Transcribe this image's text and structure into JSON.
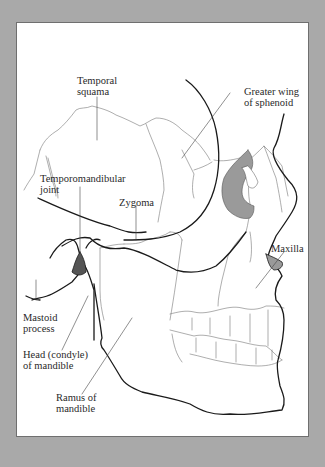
{
  "figure": {
    "background_color": "#a9a9a9",
    "frame_color": "#ffffff",
    "shade_dark": "#555555",
    "shade_mid": "#9a9a9a",
    "labels": {
      "temporal_squama": "Temporal\nsquama",
      "greater_wing": "Greater wing\nof sphenoid",
      "tmj": "Temporomandibular\njoint",
      "zygoma": "Zygoma",
      "maxilla": "Maxilla",
      "mastoid": "Mastoid\nprocess",
      "head_condyle": "Head (condyle)\nof mandible",
      "ramus": "Ramus of\nmandible"
    }
  }
}
